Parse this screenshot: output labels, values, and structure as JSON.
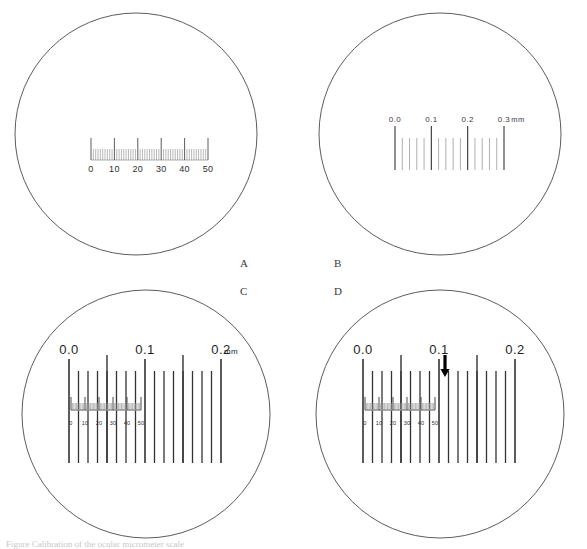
{
  "figure": {
    "background_color": "#ffffff",
    "line_color": "#333333",
    "circle_stroke": "#4a4a4a",
    "faint_tick_color": "#9a9a9a",
    "cut_off_caption": "Figure  Calibration of the ocular micrometer scale"
  },
  "panels": [
    {
      "id": "A",
      "label": "A",
      "label_x": 240,
      "label_y": 258,
      "circle": {
        "cx": 136,
        "cy": 134,
        "r": 121
      },
      "description": "Ocular micrometer scale alone",
      "ocular_scale": {
        "axis_label": "",
        "units": "arbitrary ocular divisions",
        "min": 0,
        "max": 50,
        "minor_step": 1,
        "major_step": 10,
        "tick_labels": [
          "0",
          "10",
          "20",
          "30",
          "40",
          "50"
        ],
        "tick_label_values": [
          0,
          10,
          20,
          30,
          40,
          50
        ],
        "x_start": 91,
        "x_end": 208,
        "baseline_y": 160,
        "minor_tick_height": 11,
        "major_tick_height": 22,
        "label_y": 172
      },
      "stage_scale": null,
      "arrow": null
    },
    {
      "id": "B",
      "label": "B",
      "label_x": 334,
      "label_y": 258,
      "circle": {
        "cx": 440,
        "cy": 134,
        "r": 121
      },
      "description": "Stage micrometer scale alone",
      "ocular_scale": null,
      "stage_scale": {
        "unit_label": "mm",
        "unit_label_x": 518,
        "min": 0.0,
        "max": 0.3,
        "major_step": 0.1,
        "minor_per_major": 5,
        "tick_labels": [
          "0.0",
          "0.1",
          "0.2",
          "0.3"
        ],
        "tick_label_values": [
          0.0,
          0.1,
          0.2,
          0.3
        ],
        "x_start": 395,
        "x_end": 504,
        "baseline_y": 170,
        "minor_tick_top": 138,
        "major_tick_top": 126,
        "label_y": 122
      },
      "arrow": null
    },
    {
      "id": "C",
      "label": "C",
      "label_x": 240,
      "label_y": 286,
      "circle": {
        "cx": 146,
        "cy": 414,
        "r": 124
      },
      "description": "Ocular and stage micrometer scales superimposed",
      "ocular_scale": {
        "min": 0,
        "max": 50,
        "minor_step": 1,
        "major_step": 10,
        "tick_labels": [
          "0",
          "10",
          "20",
          "30",
          "40",
          "50"
        ],
        "tick_label_values": [
          0,
          10,
          20,
          30,
          40,
          50
        ],
        "x_start": 71,
        "x_end": 141,
        "baseline_y": 410,
        "minor_tick_height": 7,
        "major_tick_height": 13,
        "label_y": 425
      },
      "stage_scale": {
        "unit_label": "mm",
        "unit_label_x": 224,
        "min": 0.0,
        "max": 0.2,
        "major_step": 0.1,
        "divisions": 16,
        "tick_labels": [
          "0.0",
          "0.1",
          "0.2"
        ],
        "tick_label_values": [
          0.0,
          0.1,
          0.2
        ],
        "x_start": 69,
        "x_end": 221,
        "line_top": 371,
        "line_bottom": 463,
        "major_line_top": 359,
        "label_y": 354
      },
      "arrow": null
    },
    {
      "id": "D",
      "label": "D",
      "label_x": 334,
      "label_y": 286,
      "circle": {
        "cx": 440,
        "cy": 414,
        "r": 124
      },
      "description": "Superimposed scales with arrow marking the coincidence point",
      "ocular_scale": {
        "min": 0,
        "max": 50,
        "minor_step": 1,
        "major_step": 10,
        "tick_labels": [
          "0",
          "10",
          "20",
          "30",
          "40",
          "50"
        ],
        "tick_label_values": [
          0,
          10,
          20,
          30,
          40,
          50
        ],
        "x_start": 365,
        "x_end": 435,
        "baseline_y": 410,
        "minor_tick_height": 7,
        "major_tick_height": 13,
        "label_y": 425
      },
      "stage_scale": {
        "unit_label": "",
        "unit_label_x": 0,
        "min": 0.0,
        "max": 0.2,
        "major_step": 0.1,
        "divisions": 16,
        "tick_labels": [
          "0.0",
          "0.1",
          "0.2"
        ],
        "tick_label_values": [
          0.0,
          0.1,
          0.2
        ],
        "x_start": 363,
        "x_end": 515,
        "line_top": 371,
        "line_bottom": 463,
        "major_line_top": 359,
        "label_y": 354
      },
      "arrow": {
        "x": 445,
        "tip_y": 377,
        "tail_y": 355,
        "points_to_ocular_value": 43,
        "points_to_stage_value_mm": 0.1,
        "color": "#000000"
      }
    }
  ],
  "chart_data": {
    "type": "diagram",
    "panel_ids": [
      "A",
      "B",
      "C",
      "D"
    ],
    "ocular_scale_range": [
      0,
      50
    ],
    "ocular_scale_ticks_labeled": [
      0,
      10,
      20,
      30,
      40,
      50
    ],
    "stage_scale_units": "mm",
    "stage_scale_range_panelB": [
      0.0,
      0.3
    ],
    "stage_scale_range_panelCD": [
      0.0,
      0.2
    ],
    "stage_scale_ticks_labeled_panelB": [
      0.0,
      0.1,
      0.2,
      0.3
    ],
    "stage_scale_ticks_labeled_panelCD": [
      0.0,
      0.1,
      0.2
    ],
    "arrow_marks_ocular_division": 43,
    "arrow_marks_stage_mm": 0.1
  }
}
